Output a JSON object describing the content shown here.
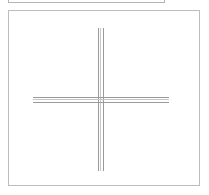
{
  "window": {
    "title": "Drawing Canvas",
    "background_color": "#ffffff"
  },
  "upper_panel": {
    "name": "partially-visible-panel-above",
    "visible_portion": "bottom-edge-only",
    "border_color": "#b4b4b4",
    "fill_color": "#ffffff"
  },
  "canvas_panel": {
    "label": "Canvas",
    "border_color": "#bdbdbd",
    "fill_color": "#ffffff",
    "width": 192,
    "height": 176
  },
  "drawing": {
    "shape_name": "crosshair",
    "description": "Large plus / crosshair formed by two pairs of parallel lines",
    "line_color": "#9a9a9a",
    "line_color_inner": "#c8c8c8",
    "center": {
      "x": 100,
      "y": 99
    },
    "vertical_arm": {
      "label": "vertical-axis-line",
      "top": 27,
      "bottom": 170,
      "line_x_positions": [
        97,
        100,
        103
      ]
    },
    "horizontal_arm": {
      "label": "horizontal-axis-line",
      "left": 32,
      "right": 168,
      "line_y_positions": [
        96,
        99,
        102
      ]
    }
  }
}
